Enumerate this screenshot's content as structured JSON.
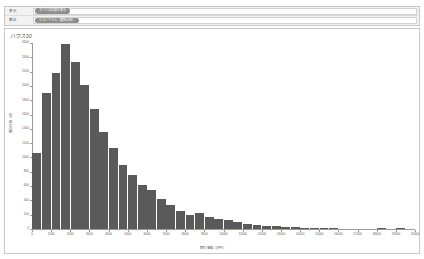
{
  "filters": {
    "rows": [
      {
        "label": "表示",
        "value": "すべての年度を表示",
        "control_name": "filter-select-display"
      },
      {
        "label": "集計",
        "value": "ヒストグラム（度数分布）",
        "control_name": "filter-select-aggregate"
      }
    ]
  },
  "card": {
    "title": "ハウス30"
  },
  "chart_data": {
    "type": "bar",
    "title": "ハウス30",
    "xlabel": "取引価格（万円）",
    "ylabel": "取引件数（件）",
    "xlim": [
      0,
      20000
    ],
    "ylim": [
      0,
      2600
    ],
    "grid": false,
    "legend": null,
    "bin_width": 500,
    "categories": [
      "0",
      "500",
      "1000",
      "1500",
      "2000",
      "2500",
      "3000",
      "3500",
      "4000",
      "4500",
      "5000",
      "5500",
      "6000",
      "6500",
      "7000",
      "7500",
      "8000",
      "8500",
      "9000",
      "9500",
      "10000",
      "10500",
      "11000",
      "11500",
      "12000",
      "12500",
      "13000",
      "13500",
      "14000",
      "14500",
      "15000",
      "15500",
      "16000",
      "16500",
      "17000",
      "17500",
      "18000",
      "18500",
      "19000",
      "19500"
    ],
    "values": [
      1060,
      1900,
      2180,
      2580,
      2340,
      2010,
      1680,
      1360,
      1130,
      900,
      760,
      620,
      540,
      420,
      330,
      250,
      200,
      230,
      170,
      140,
      120,
      95,
      70,
      60,
      48,
      38,
      30,
      24,
      20,
      14,
      10,
      8,
      6,
      5,
      4,
      3,
      10,
      3,
      16,
      2
    ],
    "yticks": [
      0,
      200,
      400,
      600,
      800,
      1000,
      1200,
      1400,
      1600,
      1800,
      2000,
      2200,
      2400,
      2600
    ],
    "ytick_labels": [
      "0",
      "200",
      "400",
      "600",
      "800",
      "1000",
      "1200",
      "1400",
      "1600",
      "1800",
      "2000",
      "2200",
      "2400",
      "2600"
    ],
    "xticks": [
      0,
      1000,
      2000,
      3000,
      4000,
      5000,
      6000,
      7000,
      8000,
      9000,
      10000,
      11000,
      12000,
      13000,
      14000,
      15000,
      16000,
      17000,
      18000,
      19000,
      20000
    ],
    "xtick_labels": [
      "0",
      "1000",
      "2000",
      "3000",
      "4000",
      "5000",
      "6000",
      "7000",
      "8000",
      "9000",
      "10000",
      "11000",
      "12000",
      "13000",
      "14000",
      "15000",
      "16000",
      "17000",
      "18000",
      "19000",
      "20000"
    ],
    "bar_color": "#5a5a5a",
    "axis_color": "#9a9a9a"
  }
}
